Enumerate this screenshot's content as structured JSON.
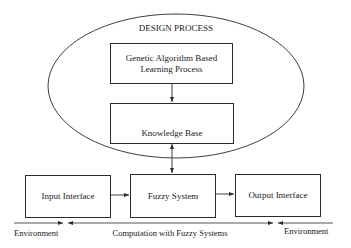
{
  "diagram": {
    "ellipse_label": "DESIGN PROCESS",
    "nodes": {
      "ga": {
        "line1": "Genetic Algorithm Based",
        "line2": "Learning Process"
      },
      "kb": {
        "label": "Knowledge Base"
      },
      "input": {
        "label": "Input Interface"
      },
      "fuzzy": {
        "label": "Fuzzy System"
      },
      "output": {
        "label": "Output Interface"
      }
    },
    "bottom": {
      "left_env": "Environment",
      "center": "Computation with Fuzzy Systems",
      "right_env": "Environment"
    },
    "colors": {
      "stroke": "#2a2a2a",
      "background": "#ffffff"
    }
  }
}
